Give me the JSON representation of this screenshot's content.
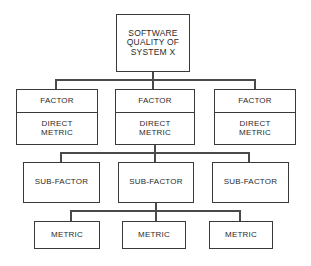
{
  "diagram": {
    "type": "tree-hierarchy",
    "style": {
      "background": "#ffffff",
      "border_color": "#3a3a3a",
      "connector_color": "#4a4a4a",
      "text_color": "#2b2b2b"
    },
    "levels": [
      {
        "level_name": "root",
        "nodes": [
          {
            "label": "SOFTWARE\nQUALITY OF\nSYSTEM X"
          }
        ]
      },
      {
        "level_name": "factor",
        "nodes": [
          {
            "label_top": "FACTOR",
            "label_bottom": "DIRECT\nMETRIC"
          },
          {
            "label_top": "FACTOR",
            "label_bottom": "DIRECT\nMETRIC"
          },
          {
            "label_top": "FACTOR",
            "label_bottom": "DIRECT\nMETRIC"
          }
        ]
      },
      {
        "level_name": "sub-factor",
        "nodes": [
          {
            "label": "SUB-FACTOR"
          },
          {
            "label": "SUB-FACTOR"
          },
          {
            "label": "SUB-FACTOR"
          }
        ]
      },
      {
        "level_name": "metric",
        "nodes": [
          {
            "label": "METRIC"
          },
          {
            "label": "METRIC"
          },
          {
            "label": "METRIC"
          }
        ]
      }
    ]
  }
}
